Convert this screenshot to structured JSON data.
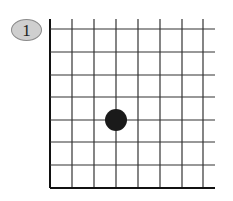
{
  "problem": {
    "label": "1"
  },
  "board": {
    "left_x": 50,
    "top_y": 29,
    "right_extend_x": 215,
    "bottom_y": 188,
    "vertical_lines_x": [
      50,
      72,
      94,
      116,
      138,
      160,
      182,
      203
    ],
    "horizontal_lines_y": [
      29,
      52,
      75,
      97,
      120,
      142,
      165,
      188
    ],
    "line_color": "#333333",
    "edge_color": "#111111",
    "edges": [
      "left",
      "bottom"
    ]
  },
  "stones": [
    {
      "color": "black",
      "fill": "#1a1a1a",
      "cx": 116,
      "cy": 120,
      "r": 11,
      "col": 3,
      "row": 4
    }
  ]
}
